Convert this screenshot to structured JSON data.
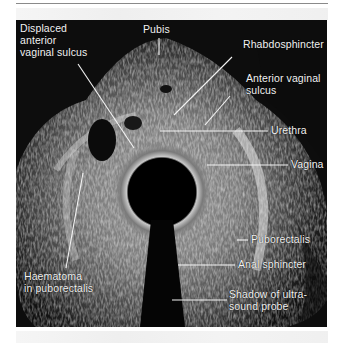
{
  "figure": {
    "type": "transvaginal ultrasound image (annotated)",
    "background_color": "#0c0c0c",
    "label_color": "#f2f2f2",
    "labels": [
      {
        "id": "displaced-anterior-vaginal-sulcus",
        "text": "Displaced\nanterior\nvaginal sulcus"
      },
      {
        "id": "pubis",
        "text": "Pubis"
      },
      {
        "id": "rhabdosphincter",
        "text": "Rhabdosphincter"
      },
      {
        "id": "anterior-vaginal-sulcus",
        "text": "Anterior vaginal\nsulcus"
      },
      {
        "id": "urethra",
        "text": "Urethra"
      },
      {
        "id": "vagina",
        "text": "Vagina"
      },
      {
        "id": "puborectalis",
        "text": "Puborectalis"
      },
      {
        "id": "anal-sphincter",
        "text": "Anal sphincter"
      },
      {
        "id": "shadow-probe",
        "text": "Shadow of ultra-\nsound probe"
      },
      {
        "id": "haematoma",
        "text": "Haematoma\nin puborectalis"
      }
    ]
  }
}
